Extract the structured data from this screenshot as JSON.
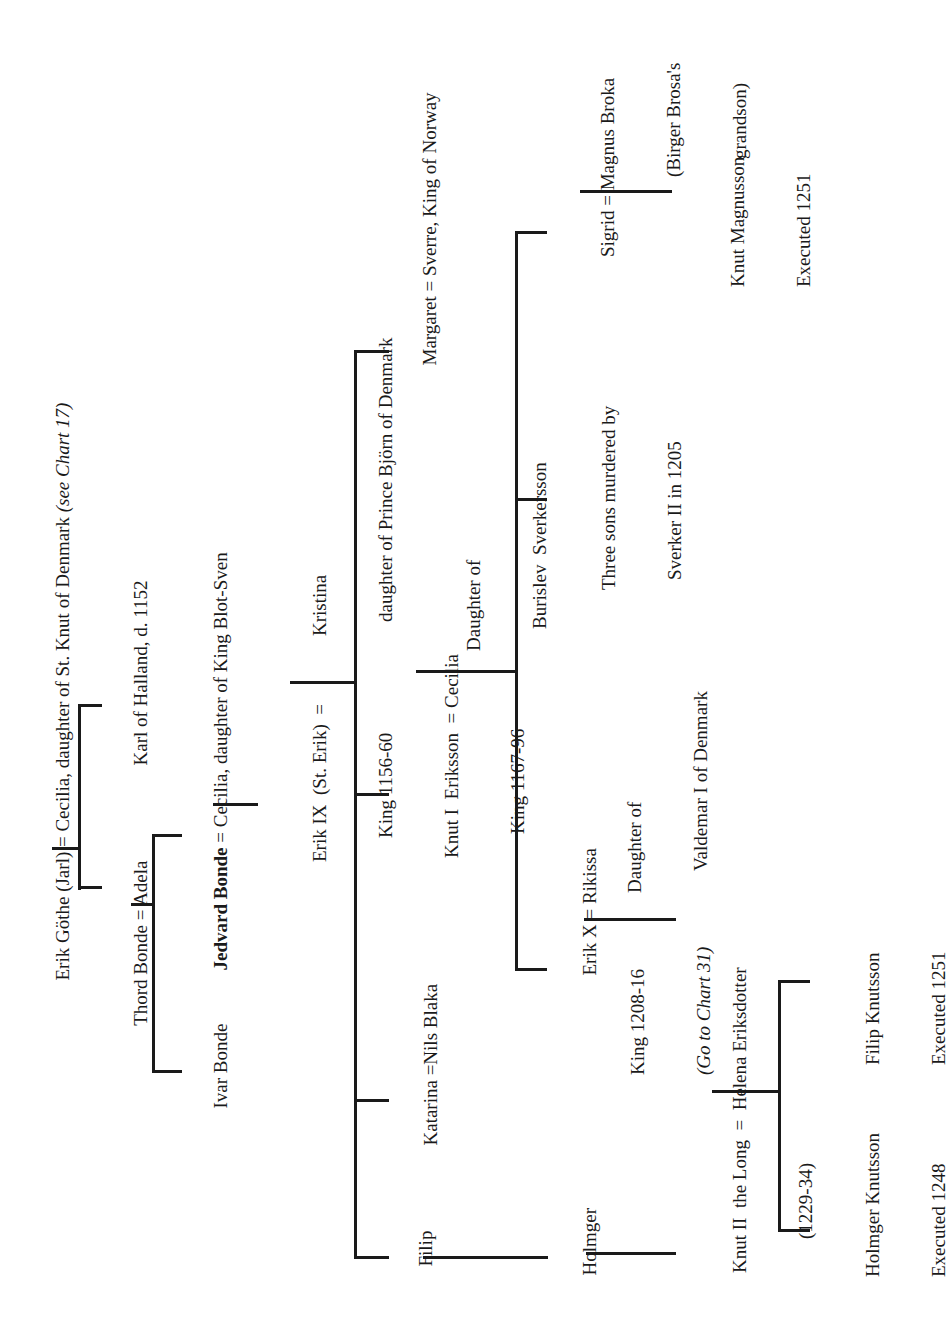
{
  "chart": {
    "orientation": "rotated-90-ccw",
    "generation_1": {
      "couple": "Erik Göthe (Jarl) = Cecilia, daughter of St. Knut of Denmark ",
      "note": "(see Chart 17)"
    },
    "generation_2": {
      "thord": "Thord Bonde = Adela",
      "karl": "Karl of Halland, d. 1152"
    },
    "generation_3": {
      "ivar": "Ivar Bonde",
      "jedvard_name": "Jedvard Bonde",
      "jedvard_spouse": " = Cecilia, daughter of King Blot-Sven"
    },
    "generation_4": {
      "erik_ix_line1": "Erik IX  (St. Erik)  =  ",
      "erik_ix_line2": "King 1156-60",
      "kristina_line1": "Kristina",
      "kristina_line2": "daughter of Prince Björn of Denmark"
    },
    "generation_5": {
      "filip": "Filip",
      "katarina": "Katarina =Nils Blaka",
      "knut_i_line1": "Knut I  Eriksson  = Cecilia",
      "knut_i_line2": "King 1167-96",
      "cecilia_line2": "Daughter of",
      "cecilia_line3": "Burislev  Sverkersson",
      "margaret": "Margaret = Sverre, King of Norway"
    },
    "generation_6": {
      "holmger": "Holmger",
      "erik_x_line1": "Erik X = Rikissa",
      "erik_x_line2": "King 1208-16",
      "erik_x_note": "(Go to Chart 31)",
      "rikissa_line2": "Daughter of",
      "rikissa_line3": "Valdemar I of Denmark",
      "three_sons_line1": "Three sons murdered by",
      "three_sons_line2": "Sverker II in 1205",
      "sigrid_line1": "Sigrid = Magnus Broka",
      "sigrid_line2": "(Birger Brosa's",
      "sigrid_line3": "grandson)"
    },
    "generation_7": {
      "knut_ii_line1": "Knut II  the Long  =  Helena Eriksdotter",
      "knut_ii_line2": "(1229-34)",
      "knut_magnusson_line1": "Knut Magnusson",
      "knut_magnusson_line2": "Executed 1251"
    },
    "generation_8": {
      "holmger_k_line1": "Holmger Knutsson",
      "holmger_k_line2": "Executed 1248",
      "filip_k_line1": "Filip Knutsson",
      "filip_k_line2": "Executed 1251"
    }
  }
}
